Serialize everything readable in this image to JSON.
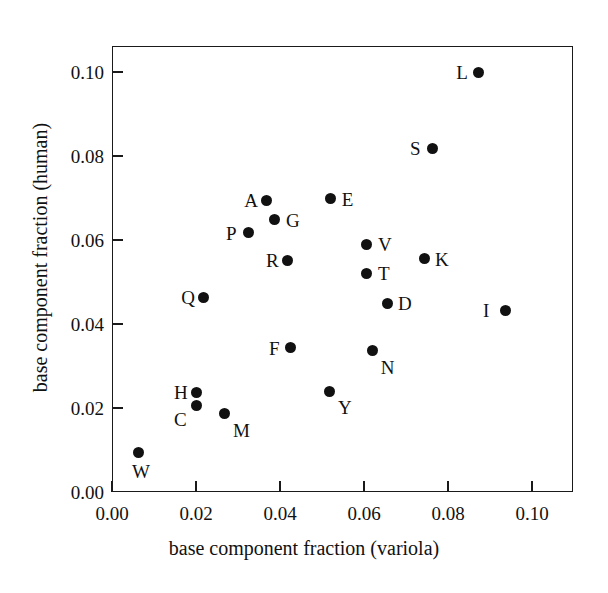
{
  "chart_data": {
    "type": "scatter",
    "title": "",
    "xlabel": "base component fraction (variola)",
    "ylabel": "base component fraction (human)",
    "xlim": [
      0.0,
      0.11
    ],
    "ylim": [
      0.0,
      0.11
    ],
    "xticks": [
      "0.00",
      "0.02",
      "0.04",
      "0.06",
      "0.08",
      "0.10"
    ],
    "xtick_values": [
      0.0,
      0.02,
      0.04,
      0.06,
      0.08,
      0.1
    ],
    "yticks": [
      "0.00",
      "0.02",
      "0.04",
      "0.06",
      "0.08",
      "0.10"
    ],
    "ytick_values": [
      0.0,
      0.02,
      0.04,
      0.06,
      0.08,
      0.1
    ],
    "grid": false,
    "legend": "none",
    "marker": "filled-circle",
    "marker_color": "#111111",
    "points": [
      {
        "label": "L",
        "x": 0.0872,
        "y": 0.1,
        "label_pos": "left"
      },
      {
        "label": "S",
        "x": 0.0762,
        "y": 0.0819,
        "label_pos": "left"
      },
      {
        "label": "A",
        "x": 0.0367,
        "y": 0.0695,
        "label_pos": "left"
      },
      {
        "label": "E",
        "x": 0.0521,
        "y": 0.0698,
        "label_pos": "right"
      },
      {
        "label": "G",
        "x": 0.0388,
        "y": 0.0648,
        "label_pos": "right"
      },
      {
        "label": "P",
        "x": 0.0324,
        "y": 0.0617,
        "label_pos": "left"
      },
      {
        "label": "V",
        "x": 0.0607,
        "y": 0.059,
        "label_pos": "right"
      },
      {
        "label": "K",
        "x": 0.0743,
        "y": 0.0555,
        "label_pos": "right"
      },
      {
        "label": "R",
        "x": 0.0419,
        "y": 0.0552,
        "label_pos": "left"
      },
      {
        "label": "T",
        "x": 0.0607,
        "y": 0.0521,
        "label_pos": "right"
      },
      {
        "label": "D",
        "x": 0.0655,
        "y": 0.045,
        "label_pos": "right"
      },
      {
        "label": "Q",
        "x": 0.0217,
        "y": 0.0464,
        "label_pos": "left"
      },
      {
        "label": "I",
        "x": 0.0936,
        "y": 0.0433,
        "label_pos": "left"
      },
      {
        "label": "F",
        "x": 0.0426,
        "y": 0.0343,
        "label_pos": "left"
      },
      {
        "label": "N",
        "x": 0.0621,
        "y": 0.0336,
        "label_pos": "below-right"
      },
      {
        "label": "Y",
        "x": 0.0519,
        "y": 0.024,
        "label_pos": "below-right"
      },
      {
        "label": "H",
        "x": 0.02,
        "y": 0.0238,
        "label_pos": "left"
      },
      {
        "label": "C",
        "x": 0.02,
        "y": 0.0205,
        "label_pos": "below-left"
      },
      {
        "label": "M",
        "x": 0.0269,
        "y": 0.0186,
        "label_pos": "below-right"
      },
      {
        "label": "W",
        "x": 0.0062,
        "y": 0.0095,
        "label_pos": "below"
      }
    ]
  }
}
